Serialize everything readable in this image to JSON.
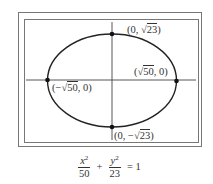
{
  "figure": {
    "type": "ellipse",
    "center": [
      0,
      0
    ],
    "a_squared": 50,
    "b_squared": 23,
    "colors": {
      "curve": "#222222",
      "axes": "#444444",
      "frame": "#777777",
      "points": "#111111"
    }
  },
  "labels": {
    "top": {
      "open": "(0, ",
      "rad": "23",
      "close": ")"
    },
    "bottom": {
      "open": "(0, −",
      "rad": "23",
      "close": ")"
    },
    "left": {
      "open": "(−",
      "rad": "50",
      "close": ", 0)"
    },
    "right": {
      "open": "(",
      "rad": "50",
      "close": ", 0)"
    }
  },
  "equation": {
    "term1_var": "x",
    "term1_exp": "2",
    "term1_den": "50",
    "plus": "+",
    "term2_var": "y",
    "term2_exp": "2",
    "term2_den": "23",
    "equals": "= 1"
  }
}
